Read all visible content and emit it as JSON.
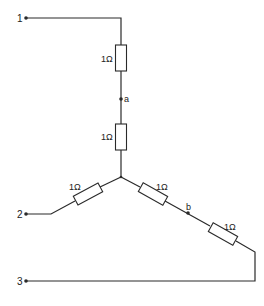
{
  "diagram": {
    "type": "resistor network",
    "colors": {
      "line": "#2a2a2a",
      "text": "#222222",
      "background": "#ffffff"
    },
    "terminals": [
      {
        "id": "1",
        "label": "1"
      },
      {
        "id": "2",
        "label": "2"
      },
      {
        "id": "3",
        "label": "3"
      }
    ],
    "nodes": [
      {
        "id": "a",
        "label": "a"
      },
      {
        "id": "b",
        "label": "b"
      }
    ],
    "resistors": [
      {
        "id": "R1",
        "label": "1Ω",
        "between": [
          "terminal-1",
          "node-a"
        ]
      },
      {
        "id": "R2",
        "label": "1Ω",
        "between": [
          "node-a",
          "center"
        ]
      },
      {
        "id": "R3",
        "label": "1Ω",
        "between": [
          "terminal-2",
          "center"
        ]
      },
      {
        "id": "R4",
        "label": "1Ω",
        "between": [
          "center",
          "node-b"
        ]
      },
      {
        "id": "R5",
        "label": "1Ω",
        "between": [
          "node-b",
          "terminal-3"
        ]
      }
    ]
  }
}
